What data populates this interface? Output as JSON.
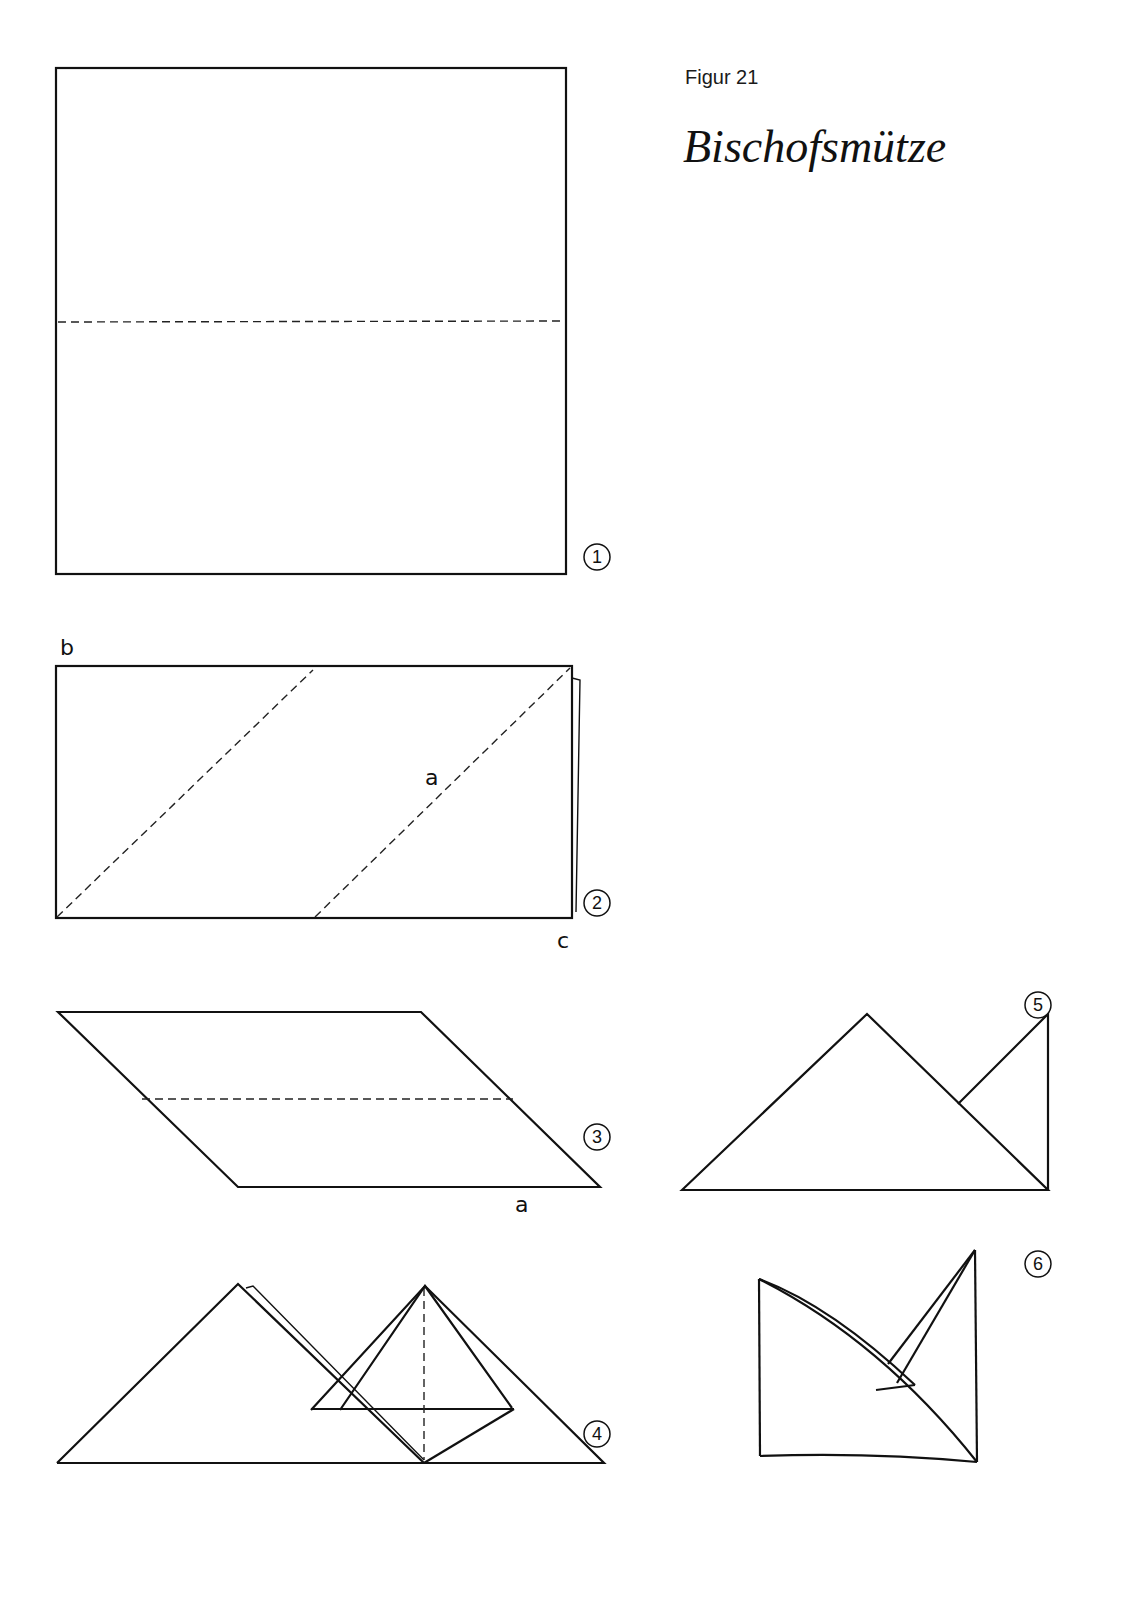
{
  "header": {
    "figure_label": "Figur 21",
    "title": "Bischofsmütze"
  },
  "steps": [
    {
      "number": "1",
      "description": "square with horizontal dashed fold line"
    },
    {
      "number": "2",
      "description": "rectangle with two diagonal dashed fold lines",
      "labels": {
        "top_left": "b",
        "middle": "a",
        "bottom_right": "c"
      }
    },
    {
      "number": "3",
      "description": "parallelogram with horizontal dashed fold line",
      "labels": {
        "bottom": "a"
      }
    },
    {
      "number": "4",
      "description": "two triangles with folded diamond, dashed vertical line"
    },
    {
      "number": "5",
      "description": "triangle with folded right flap"
    },
    {
      "number": "6",
      "description": "finished bishop's mitre"
    }
  ]
}
